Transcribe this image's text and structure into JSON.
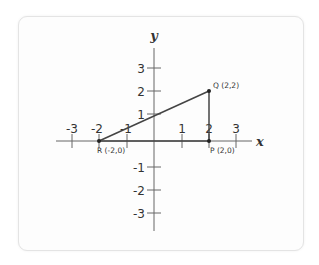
{
  "diagram": {
    "axes": {
      "x_name": "x",
      "y_name": "y",
      "x_ticks": [
        {
          "value": -3,
          "label": "-3"
        },
        {
          "value": -2,
          "label": "-2"
        },
        {
          "value": -1,
          "label": "-1"
        },
        {
          "value": 1,
          "label": "1"
        },
        {
          "value": 2,
          "label": "2"
        },
        {
          "value": 3,
          "label": "3"
        }
      ],
      "y_ticks": [
        {
          "value": 3,
          "label": "3"
        },
        {
          "value": 2,
          "label": "2"
        },
        {
          "value": 1,
          "label": "1"
        },
        {
          "value": -1,
          "label": "-1"
        },
        {
          "value": -2,
          "label": "-2"
        },
        {
          "value": -3,
          "label": "-3"
        }
      ]
    },
    "points": [
      {
        "name": "Q",
        "x": 2,
        "y": 2,
        "label": "Q (2,2)"
      },
      {
        "name": "R",
        "x": -2,
        "y": 0,
        "label": "R (-2,0)"
      },
      {
        "name": "P",
        "x": 2,
        "y": 0,
        "label": "P (2,0)"
      }
    ],
    "segments": [
      [
        "R",
        "Q"
      ],
      [
        "Q",
        "P"
      ],
      [
        "P",
        "R"
      ]
    ],
    "colors": {
      "axis": "#555555",
      "triangle": "#444444",
      "point": "#222222"
    }
  }
}
